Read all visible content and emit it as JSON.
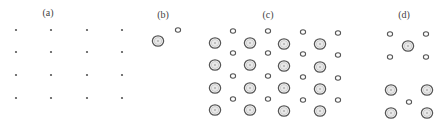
{
  "figure": {
    "panels": [
      {
        "id": "a",
        "label": "(a)",
        "label_pos": [
          48,
          16
        ],
        "description": "square lattice of point sites",
        "dots": [
          [
            16,
            30
          ],
          [
            51,
            30
          ],
          [
            87,
            30
          ],
          [
            122,
            30
          ],
          [
            16,
            52
          ],
          [
            51,
            52
          ],
          [
            87,
            52
          ],
          [
            122,
            52
          ],
          [
            16,
            75
          ],
          [
            51,
            75
          ],
          [
            87,
            75
          ],
          [
            122,
            75
          ],
          [
            16,
            98
          ],
          [
            51,
            98
          ],
          [
            87,
            98
          ],
          [
            122,
            98
          ]
        ]
      },
      {
        "id": "b",
        "label": "(b)",
        "label_pos": [
          163,
          18
        ],
        "description": "unit cell with one large and one small ring",
        "small": [
          [
            178,
            30
          ]
        ],
        "big": [
          [
            158,
            41
          ]
        ]
      },
      {
        "id": "c",
        "label": "(c)",
        "label_pos": [
          268,
          18
        ],
        "description": "lattice decorated with large and small rings",
        "small": [
          [
            233,
            31
          ],
          [
            268,
            31
          ],
          [
            303,
            32
          ],
          [
            338,
            33
          ],
          [
            233,
            53
          ],
          [
            268,
            53
          ],
          [
            303,
            54
          ],
          [
            338,
            55
          ],
          [
            233,
            76
          ],
          [
            268,
            76
          ],
          [
            303,
            77
          ],
          [
            338,
            78
          ],
          [
            233,
            99
          ],
          [
            268,
            99
          ],
          [
            303,
            100
          ],
          [
            338,
            100
          ]
        ],
        "big": [
          [
            215,
            43
          ],
          [
            250,
            43
          ],
          [
            284,
            44
          ],
          [
            320,
            44
          ],
          [
            215,
            65
          ],
          [
            250,
            65
          ],
          [
            284,
            66
          ],
          [
            320,
            67
          ],
          [
            215,
            88
          ],
          [
            250,
            88
          ],
          [
            284,
            88
          ],
          [
            320,
            89
          ],
          [
            215,
            110
          ],
          [
            250,
            110
          ],
          [
            284,
            111
          ],
          [
            320,
            111
          ]
        ]
      },
      {
        "id": "d",
        "label": "(d)",
        "label_pos": [
          404,
          18
        ],
        "description": "two local configurations",
        "small": [
          [
            390,
            34
          ],
          [
            426,
            34
          ],
          [
            390,
            57
          ],
          [
            426,
            57
          ],
          [
            409,
            102
          ]
        ],
        "big": [
          [
            408,
            46
          ],
          [
            391,
            90
          ],
          [
            427,
            90
          ],
          [
            391,
            113
          ],
          [
            427,
            113
          ]
        ]
      }
    ]
  }
}
